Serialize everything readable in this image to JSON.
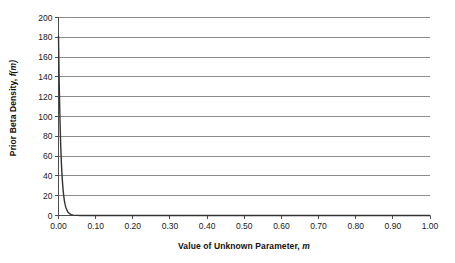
{
  "chart_data": {
    "type": "line",
    "title": "",
    "xlabel": "Value of Unknown Parameter, m",
    "xlabel_plain": "Value of Unknown Parameter,",
    "xlabel_italic": "m",
    "ylabel": "Prior Beta Density, f(m)",
    "ylabel_plain": "Prior Beta Density,",
    "ylabel_italic": "f(m)",
    "xlim": [
      0.0,
      1.0
    ],
    "ylim": [
      0,
      200
    ],
    "xticks": [
      "0.00",
      "0.10",
      "0.20",
      "0.30",
      "0.40",
      "0.50",
      "0.60",
      "0.70",
      "0.80",
      "0.90",
      "1.00"
    ],
    "xtick_values": [
      0.0,
      0.1,
      0.2,
      0.3,
      0.4,
      0.5,
      0.6,
      0.7,
      0.8,
      0.9,
      1.0
    ],
    "yticks": [
      "0",
      "20",
      "40",
      "60",
      "80",
      "100",
      "120",
      "140",
      "160",
      "180",
      "200"
    ],
    "ytick_values": [
      0,
      20,
      40,
      60,
      80,
      100,
      120,
      140,
      160,
      180,
      200
    ],
    "grid": "horizontal",
    "legend": "none",
    "series": [
      {
        "name": "Prior Beta Density",
        "color": "#333333",
        "x": [
          0.0,
          0.002,
          0.004,
          0.006,
          0.008,
          0.01,
          0.012,
          0.014,
          0.016,
          0.018,
          0.02,
          0.025,
          0.03,
          0.035,
          0.04,
          0.05,
          0.06,
          0.08,
          0.1,
          0.15,
          0.2,
          0.3,
          0.4,
          0.5,
          0.6,
          0.7,
          0.8,
          0.9,
          1.0
        ],
        "values": [
          181.0,
          132.0,
          96.0,
          70.0,
          51.0,
          37.5,
          27.4,
          20.0,
          14.6,
          10.7,
          7.8,
          3.6,
          1.7,
          0.8,
          0.4,
          0.1,
          0.0,
          0.0,
          0.0,
          0.0,
          0.0,
          0.0,
          0.0,
          0.0,
          0.0,
          0.0,
          0.0,
          0.0,
          0.0
        ]
      }
    ]
  },
  "style": {
    "grid_color": "#8c8c8c",
    "axis_color": "#4d4d4d",
    "curve_color": "#333333",
    "background": "#ffffff"
  }
}
